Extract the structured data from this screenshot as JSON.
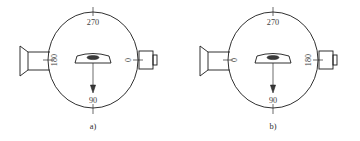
{
  "figure": {
    "background_color": "#ffffff",
    "line_color": "#1a1a1a",
    "label_color": "#3d3d3d",
    "panels": [
      {
        "id": "panel-a",
        "caption": "a)",
        "center": {
          "x": 93,
          "y": 60
        },
        "radius_x": 45,
        "radius_y": 48,
        "angle_labels": {
          "top": "270",
          "bottom": "90",
          "left": "180",
          "right": "0"
        },
        "source": {
          "side": "left",
          "name": "source-horn"
        },
        "detector": {
          "side": "right",
          "name": "detector-box"
        },
        "sample": {
          "name": "sample-holder",
          "arrow_direction": "down"
        }
      },
      {
        "id": "panel-b",
        "caption": "b)",
        "center": {
          "x": 273,
          "y": 60
        },
        "radius_x": 45,
        "radius_y": 48,
        "angle_labels": {
          "top": "270",
          "bottom": "90",
          "left": "0",
          "right": "180"
        },
        "source": {
          "side": "left",
          "name": "source-horn"
        },
        "detector": {
          "side": "right",
          "name": "detector-box"
        },
        "sample": {
          "name": "sample-holder",
          "arrow_direction": "down"
        }
      }
    ]
  }
}
